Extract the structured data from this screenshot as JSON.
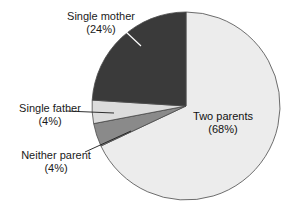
{
  "chart_data": {
    "type": "pie",
    "title": "",
    "subtitle": "",
    "xlabel": "",
    "ylabel": "",
    "legend_position": "none",
    "grid": false,
    "units": "percent",
    "start_angle_deg": 0,
    "direction": "clockwise",
    "center": {
      "x": 186,
      "y": 106
    },
    "radius": 94,
    "categories": [
      "Two parents",
      "Neither parent",
      "Single father",
      "Single mother"
    ],
    "values": [
      68,
      4,
      4,
      24
    ],
    "slices": [
      {
        "name": "two-parents",
        "label": "Two parents",
        "value_label": "(68%)",
        "value": 68,
        "color": "#ececec",
        "label_placement": "inside",
        "label_x": 223,
        "label_y": 120,
        "label_value_x": 223,
        "label_value_y": 133,
        "leader": false
      },
      {
        "name": "neither-parent",
        "label": "Neither parent",
        "value_label": "(4%)",
        "value": 4,
        "color": "#8a8a8a",
        "label_placement": "outside-left",
        "label_x": 56,
        "label_y": 159,
        "label_value_x": 56,
        "label_value_y": 172,
        "leader": true,
        "leader_points": "85,152 131,131"
      },
      {
        "name": "single-father",
        "label": "Single father",
        "value_label": "(4%)",
        "value": 4,
        "color": "#dcdcdc",
        "label_placement": "outside-left",
        "label_x": 50,
        "label_y": 112,
        "label_value_x": 50,
        "label_value_y": 125,
        "leader": true,
        "leader_points": "66,111 114,113"
      },
      {
        "name": "single-mother",
        "label": "Single mother",
        "value_label": "(24%)",
        "value": 24,
        "color": "#3a3a3a",
        "label_placement": "outside-top",
        "label_x": 101,
        "label_y": 20,
        "label_value_x": 101,
        "label_value_y": 33,
        "leader": true,
        "leader_points": "124,30 141,46"
      }
    ],
    "colors": {
      "two_parents": "#ececec",
      "neither_parent": "#8a8a8a",
      "single_father": "#dcdcdc",
      "single_mother": "#3a3a3a",
      "outline": "#4a4a4a",
      "background": "#ffffff",
      "text": "#1a1a1a"
    }
  }
}
